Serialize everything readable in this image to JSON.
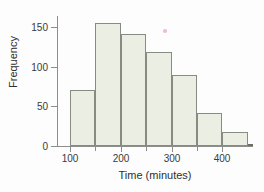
{
  "chart_data": {
    "type": "bar",
    "title": "",
    "xlabel": "Time (minutes)",
    "ylabel": "Frequency",
    "xlim": [
      75,
      460
    ],
    "ylim": [
      0,
      165
    ],
    "grid": false,
    "legend": null,
    "bin_width": 50,
    "bin_edges": [
      100,
      150,
      200,
      250,
      300,
      350,
      400,
      450
    ],
    "categories": [
      "100-150",
      "150-200",
      "200-250",
      "250-300",
      "300-350",
      "350-400",
      "400-450"
    ],
    "values": [
      71,
      155,
      141,
      118,
      89,
      41,
      18
    ],
    "x_ticks_major": [
      100,
      200,
      300,
      400
    ],
    "x_tick_labels": [
      "100",
      "200",
      "300",
      "400"
    ],
    "x_ticks_minor": [
      150,
      250,
      350
    ],
    "y_ticks": [
      0,
      50,
      100,
      150
    ],
    "y_tick_labels": [
      "0",
      "50",
      "100",
      "150"
    ],
    "bar_fill_color": "#eaeee3",
    "bar_edge_color": "#868c82",
    "axis_color": "#8d8d8d",
    "text_color": "#2f2f2f",
    "background_color": "#fdfdfd",
    "annotations": [
      {
        "name": "scan-artifact-dot",
        "x": 300,
        "y": 150,
        "color": "#e87ec0"
      }
    ]
  }
}
